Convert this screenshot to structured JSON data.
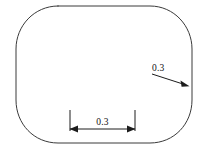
{
  "diagram": {
    "shape": {
      "name": "stadium-obround-outline",
      "stroke_color": "#3a3a3a"
    },
    "background_color": "#ffffff",
    "line_color": "#1c1c1c",
    "annotations": {
      "radius_dimension": {
        "label": "0.3",
        "kind": "radius-leader",
        "points_to": "right-arc"
      },
      "linear_dimension": {
        "label": "0.3",
        "kind": "horizontal-linear",
        "location": "bottom-interior"
      }
    }
  }
}
